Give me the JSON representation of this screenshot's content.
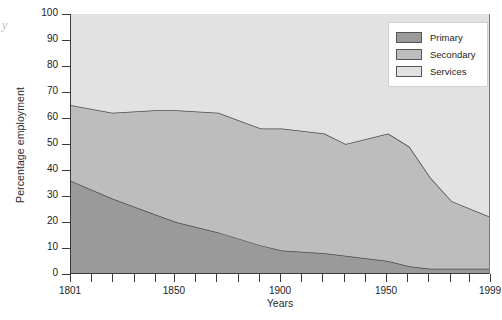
{
  "figure": {
    "corner_mark": "y"
  },
  "chart_data": {
    "type": "area",
    "stacked": true,
    "title": "",
    "xlabel": "Years",
    "ylabel": "Percentage employment",
    "xlim": [
      1801,
      1999
    ],
    "ylim": [
      0,
      100
    ],
    "grid": false,
    "legend_position": "top-right",
    "x_tick_values": [
      1801,
      1811,
      1821,
      1831,
      1841,
      1850,
      1860,
      1870,
      1880,
      1890,
      1900,
      1910,
      1920,
      1930,
      1940,
      1950,
      1960,
      1970,
      1980,
      1989,
      1999
    ],
    "x_tick_labels": [
      "1801",
      "",
      "",
      "",
      "",
      "1850",
      "",
      "",
      "",
      "",
      "1900",
      "",
      "",
      "",
      "",
      "1950",
      "",
      "",
      "",
      "",
      "1999"
    ],
    "y_tick_values": [
      0,
      10,
      20,
      30,
      40,
      50,
      60,
      70,
      80,
      90,
      100
    ],
    "y_tick_labels": [
      "0",
      "10",
      "20",
      "30",
      "40",
      "50",
      "60",
      "70",
      "80",
      "90",
      "100"
    ],
    "x": [
      1801,
      1821,
      1841,
      1851,
      1871,
      1891,
      1901,
      1921,
      1931,
      1951,
      1961,
      1971,
      1981,
      1999
    ],
    "series": [
      {
        "name": "Primary",
        "color": "#9a9a9a",
        "values": [
          36,
          29,
          23,
          20,
          16,
          11,
          9,
          8,
          7,
          5,
          3,
          2,
          2,
          2
        ]
      },
      {
        "name": "Secondary",
        "color": "#bdbdbd",
        "values": [
          29,
          33,
          40,
          43,
          46,
          45,
          47,
          46,
          43,
          49,
          46,
          35,
          26,
          20
        ]
      },
      {
        "name": "Services",
        "color": "#e2e2e2",
        "values": [
          35,
          38,
          37,
          37,
          38,
          44,
          44,
          46,
          50,
          46,
          51,
          63,
          72,
          78
        ]
      }
    ],
    "cumulative_top_primary": [
      36,
      29,
      23,
      20,
      16,
      11,
      9,
      8,
      7,
      5,
      3,
      2,
      2,
      2
    ],
    "cumulative_top_secondary": [
      65,
      62,
      63,
      63,
      62,
      56,
      56,
      54,
      50,
      54,
      49,
      37,
      28,
      22
    ]
  },
  "legend": {
    "items": [
      {
        "label": "Primary",
        "color": "#9a9a9a"
      },
      {
        "label": "Secondary",
        "color": "#bdbdbd"
      },
      {
        "label": "Services",
        "color": "#e2e2e2"
      }
    ]
  }
}
